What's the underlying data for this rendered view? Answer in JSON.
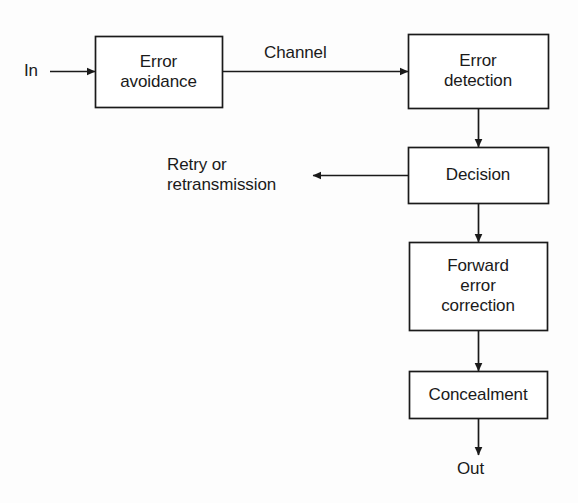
{
  "diagram": {
    "canvas": {
      "width": 578,
      "height": 503,
      "background": "#fdfdfd"
    },
    "stroke_color": "#1a1a1a",
    "text_color": "#1a1a1a",
    "boxes": [
      {
        "id": "error-avoidance",
        "label": "Error\navoidance",
        "x": 95,
        "y": 36,
        "w": 127,
        "h": 71
      },
      {
        "id": "error-detection",
        "label": "Error\ndetection",
        "x": 408,
        "y": 34,
        "w": 140,
        "h": 74
      },
      {
        "id": "decision",
        "label": "Decision",
        "x": 408,
        "y": 147,
        "w": 140,
        "h": 56
      },
      {
        "id": "forward-error-correction",
        "label": "Forward\nerror\ncorrection",
        "x": 409,
        "y": 242,
        "w": 138,
        "h": 88
      },
      {
        "id": "concealment",
        "label": "Concealment",
        "x": 409,
        "y": 371,
        "w": 138,
        "h": 47
      }
    ],
    "labels": [
      {
        "id": "in-label",
        "text": "In",
        "x": 24,
        "y": 61,
        "align": "left"
      },
      {
        "id": "channel-label",
        "text": "Channel",
        "x": 264,
        "y": 43,
        "align": "left"
      },
      {
        "id": "retry-label",
        "text": "Retry or\nretransmission",
        "x": 167,
        "y": 155,
        "align": "left"
      },
      {
        "id": "out-label",
        "text": "Out",
        "x": 457,
        "y": 459,
        "align": "left"
      }
    ],
    "connectors": [
      {
        "id": "in-to-error-avoidance",
        "from": "In",
        "to": "Error avoidance"
      },
      {
        "id": "error-avoidance-to-error-detection",
        "from": "Error avoidance",
        "to": "Error detection",
        "label": "Channel"
      },
      {
        "id": "error-detection-to-decision",
        "from": "Error detection",
        "to": "Decision"
      },
      {
        "id": "decision-to-retry",
        "from": "Decision",
        "to": "Retry or retransmission"
      },
      {
        "id": "decision-to-forward-error-correction",
        "from": "Decision",
        "to": "Forward error correction"
      },
      {
        "id": "forward-error-correction-to-concealment",
        "from": "Forward error correction",
        "to": "Concealment"
      },
      {
        "id": "concealment-to-out",
        "from": "Concealment",
        "to": "Out"
      }
    ]
  }
}
